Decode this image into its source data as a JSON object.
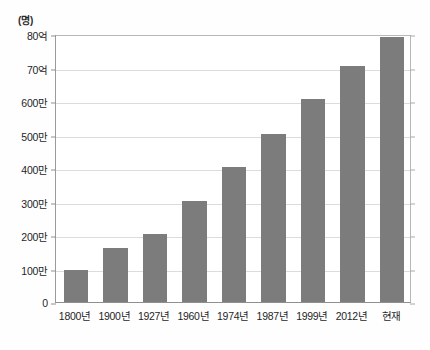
{
  "chart_data": {
    "type": "bar",
    "title": "",
    "subtitle": "",
    "xlabel": "",
    "ylabel": "(명)",
    "unit_label": "(명)",
    "grid": true,
    "legend": null,
    "categories": [
      "1800년",
      "1900년",
      "1927년",
      "1960년",
      "1974년",
      "1987년",
      "1999년",
      "2012년",
      "현재"
    ],
    "values": [
      0.96,
      1.6,
      2.02,
      3.02,
      4.03,
      5.03,
      6.05,
      7.05,
      7.9
    ],
    "value_unit": "billion people (십억 명)",
    "ytick_labels": [
      "0",
      "100만",
      "200만",
      "300만",
      "400만",
      "500만",
      "600만",
      "70억",
      "80억"
    ],
    "ytick_values": [
      0,
      1,
      2,
      3,
      4,
      5,
      6,
      7,
      8
    ],
    "ylim": [
      0,
      8
    ],
    "bar_color": "#7c7c7c",
    "grid_color": "#dcdcdc",
    "axis_color": "#8f8f8f",
    "background_color": "#ffffff"
  }
}
